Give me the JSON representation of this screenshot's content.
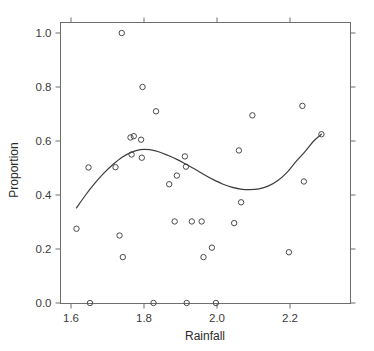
{
  "chart_data": {
    "type": "scatter",
    "title": "",
    "xlabel": "Rainfall",
    "ylabel": "Proportion",
    "xlim": [
      1.585,
      2.31
    ],
    "ylim": [
      -0.03,
      1.04
    ],
    "grid": false,
    "legend": null,
    "xticks": [
      1.6,
      1.8,
      2.0,
      2.2
    ],
    "xticklabels": [
      "1.6",
      "1.8",
      "2.0",
      "2.2"
    ],
    "yticks": [
      0.0,
      0.2,
      0.4,
      0.6,
      0.8,
      1.0
    ],
    "yticklabels": [
      "0.0",
      "0.2",
      "0.4",
      "0.6",
      "0.8",
      "1.0"
    ],
    "marker": "open-circle",
    "points": [
      {
        "x": 1.615,
        "y": 0.275
      },
      {
        "x": 1.648,
        "y": 0.502
      },
      {
        "x": 1.652,
        "y": 0.0
      },
      {
        "x": 1.722,
        "y": 0.503
      },
      {
        "x": 1.733,
        "y": 0.25
      },
      {
        "x": 1.739,
        "y": 1.0
      },
      {
        "x": 1.742,
        "y": 0.17
      },
      {
        "x": 1.763,
        "y": 0.613
      },
      {
        "x": 1.766,
        "y": 0.55
      },
      {
        "x": 1.772,
        "y": 0.618
      },
      {
        "x": 1.792,
        "y": 0.605
      },
      {
        "x": 1.794,
        "y": 0.538
      },
      {
        "x": 1.796,
        "y": 0.8
      },
      {
        "x": 1.826,
        "y": 0.0
      },
      {
        "x": 1.833,
        "y": 0.71
      },
      {
        "x": 1.869,
        "y": 0.44
      },
      {
        "x": 1.884,
        "y": 0.302
      },
      {
        "x": 1.89,
        "y": 0.472
      },
      {
        "x": 1.912,
        "y": 0.543
      },
      {
        "x": 1.915,
        "y": 0.505
      },
      {
        "x": 1.917,
        "y": 0.0
      },
      {
        "x": 1.931,
        "y": 0.302
      },
      {
        "x": 1.958,
        "y": 0.302
      },
      {
        "x": 1.963,
        "y": 0.17
      },
      {
        "x": 1.986,
        "y": 0.205
      },
      {
        "x": 1.997,
        "y": 0.0
      },
      {
        "x": 2.047,
        "y": 0.296
      },
      {
        "x": 2.06,
        "y": 0.565
      },
      {
        "x": 2.066,
        "y": 0.373
      },
      {
        "x": 2.097,
        "y": 0.695
      },
      {
        "x": 2.197,
        "y": 0.188
      },
      {
        "x": 2.234,
        "y": 0.73
      },
      {
        "x": 2.238,
        "y": 0.45
      },
      {
        "x": 2.286,
        "y": 0.625
      }
    ],
    "fit_curve": {
      "name": "fitted-curve",
      "x": [
        1.615,
        1.64,
        1.665,
        1.69,
        1.715,
        1.74,
        1.765,
        1.79,
        1.815,
        1.84,
        1.865,
        1.89,
        1.915,
        1.94,
        1.965,
        1.99,
        2.015,
        2.04,
        2.065,
        2.09,
        2.115,
        2.14,
        2.165,
        2.19,
        2.215,
        2.24,
        2.265,
        2.286
      ],
      "y": [
        0.352,
        0.4,
        0.443,
        0.481,
        0.513,
        0.54,
        0.558,
        0.568,
        0.568,
        0.56,
        0.547,
        0.532,
        0.514,
        0.495,
        0.475,
        0.457,
        0.441,
        0.429,
        0.422,
        0.42,
        0.423,
        0.433,
        0.452,
        0.481,
        0.522,
        0.559,
        0.6,
        0.625
      ]
    }
  },
  "axes": {
    "x_title": "Rainfall",
    "y_title": "Proportion"
  },
  "colors": {
    "marker_stroke": "#4a4a4a",
    "curve": "#3d3d3d",
    "frame": "#6e6e6e",
    "text": "#2b2b2b",
    "background": "#ffffff"
  }
}
